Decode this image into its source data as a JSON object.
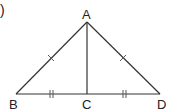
{
  "diagram": {
    "type": "geometry-triangle",
    "prefix_mark": ")",
    "points": {
      "A": {
        "label": "A",
        "x": 87,
        "y": 22
      },
      "B": {
        "label": "B",
        "x": 16,
        "y": 94
      },
      "C": {
        "label": "C",
        "x": 87,
        "y": 94
      },
      "D": {
        "label": "D",
        "x": 160,
        "y": 94
      }
    },
    "segments": [
      {
        "from": "A",
        "to": "B",
        "ticks": 1
      },
      {
        "from": "A",
        "to": "D",
        "ticks": 1
      },
      {
        "from": "B",
        "to": "C",
        "ticks": 2
      },
      {
        "from": "C",
        "to": "D",
        "ticks": 2
      },
      {
        "from": "A",
        "to": "C",
        "ticks": 0
      }
    ],
    "line_color": "#333333"
  }
}
